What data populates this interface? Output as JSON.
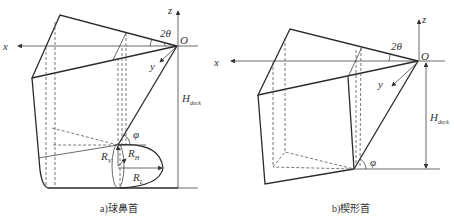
{
  "figure_a": {
    "caption": "a)球鼻首",
    "labels": {
      "x_axis": "x",
      "y_axis": "y",
      "z_axis": "z",
      "origin": "O",
      "angle_top": "2θ",
      "angle_flare": "φ",
      "height_main": "H",
      "height_sub": "deck",
      "radius_v_main": "R",
      "radius_v_sub": "V",
      "radius_h_main": "R",
      "radius_h_sub": "H",
      "radius_l_main": "R",
      "radius_l_sub": "L"
    }
  },
  "figure_b": {
    "caption": "b)楔形首",
    "labels": {
      "x_axis": "x",
      "y_axis": "y",
      "z_axis": "z",
      "origin": "O",
      "angle_top": "2θ",
      "angle_flare": "φ",
      "height_main": "H",
      "height_sub": "deck"
    }
  }
}
